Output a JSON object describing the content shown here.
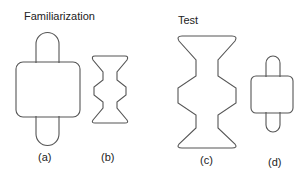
{
  "headings": {
    "familiarization": "Familiarization",
    "test": "Test"
  },
  "labels": {
    "a": "(a)",
    "b": "(b)",
    "c": "(c)",
    "d": "(d)"
  },
  "stroke_color": "#555555"
}
